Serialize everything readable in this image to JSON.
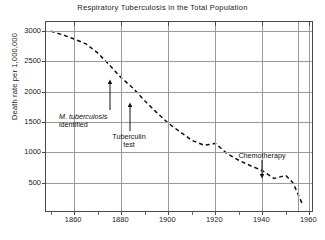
{
  "chart_data": {
    "type": "line",
    "title": "Respiratory Tuberculosis in the Total Population",
    "xlabel": "",
    "ylabel": "Death rate per 1,000,000",
    "xlim": [
      1848,
      1962
    ],
    "ylim": [
      0,
      3150
    ],
    "grid": true,
    "legend": "none",
    "line_style": "dashed",
    "line_color": "#111111",
    "xticks": [
      1860,
      1880,
      1900,
      1920,
      1940,
      1960
    ],
    "xtick_labels": [
      "1860",
      "1880",
      "1900",
      "1920",
      "1940",
      "1960"
    ],
    "yticks": [
      500,
      1000,
      1500,
      2000,
      2500,
      3000
    ],
    "ytick_labels": [
      "500",
      "1000",
      "1500",
      "2000",
      "2500",
      "3000"
    ],
    "series": [
      {
        "name": "Respiratory tuberculosis death rate",
        "x": [
          1850,
          1855,
          1860,
          1865,
          1870,
          1875,
          1880,
          1885,
          1890,
          1895,
          1900,
          1905,
          1910,
          1915,
          1918,
          1920,
          1925,
          1930,
          1935,
          1940,
          1945,
          1948,
          1950,
          1953,
          1955,
          1957
        ],
        "values": [
          3000,
          2940,
          2870,
          2790,
          2640,
          2440,
          2230,
          2060,
          1850,
          1660,
          1480,
          1340,
          1200,
          1120,
          1130,
          1150,
          980,
          870,
          780,
          700,
          570,
          600,
          620,
          500,
          330,
          150
        ]
      }
    ],
    "annotations": [
      {
        "label_line1": "M. tuberculosis",
        "label_line2": "identified",
        "italic_line1": true,
        "x": 1882,
        "y": 2100
      },
      {
        "label_line1": "Tuberculin",
        "label_line2": "test",
        "italic_line1": false,
        "x": 1890,
        "y": 1850
      },
      {
        "label_line1": "Chemotherapy",
        "label_line2": "",
        "italic_line1": false,
        "x": 1947,
        "y": 610
      }
    ]
  },
  "annotation_text": {
    "mtb_line1": "M. tuberculosis",
    "mtb_line2": "identified",
    "tuberculin_line1": "Tuberculin",
    "tuberculin_line2": "test",
    "chemo_line1": "Chemotherapy"
  },
  "colors": {
    "background": "#ffffff",
    "axis": "#4a4a4a",
    "grid": "#9a9a9a",
    "line": "#111111",
    "text": "#222222"
  }
}
